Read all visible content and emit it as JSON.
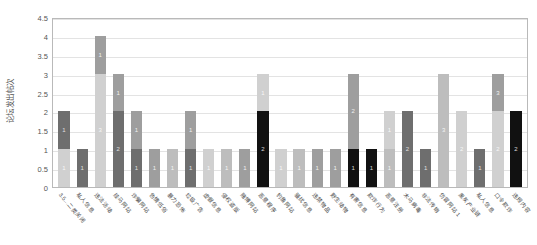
{
  "chart": {
    "type": "bar",
    "title": "",
    "ylabel": "论坛发出帖次",
    "xlabel": ""
  },
  "axis": {
    "yticks": [
      "0",
      "0.5",
      "1",
      "1.5",
      "2",
      "2.5",
      "3",
      "3.5",
      "4",
      "4.5"
    ],
    "ymin": 0,
    "ymax": 4.5
  },
  "colors": {
    "light": "#d0d0d0",
    "mid_light": "#bdbdbd",
    "mid": "#9e9e9e",
    "dark": "#6e6e6e",
    "black": "#111111",
    "grid": "#e3e3e3",
    "frame": "#b9b9b9"
  },
  "chart_data": {
    "type": "bar",
    "title": "",
    "xlabel": "",
    "ylabel": "论坛发出帖次",
    "ylim": [
      0,
      4.5
    ],
    "grid": true,
    "legend": "none",
    "stacked": true,
    "categories": [
      "3.5…二类关闭",
      "私人信息",
      "违法活动",
      "挂马网站",
      "诈骗网站",
      "色情低俗",
      "暴力恐怖",
      "垃圾广告",
      "虚假信息",
      "侵权盗版",
      "赌博网站",
      "恶意程序",
      "钓鱼网站",
      "骚扰信息",
      "违禁物品",
      "野生动物",
      "有害信息",
      "欺诈行为",
      "恶意注册",
      "木马病毒",
      "非法传销",
      "仿冒网站 1",
      "黑灰产业链",
      "私人信息",
      "口令欺诈",
      "违规内容"
    ],
    "values": [
      2,
      1,
      4,
      3,
      2,
      1,
      1,
      2,
      1,
      1,
      1,
      3,
      1,
      1,
      1,
      1,
      3,
      1,
      2,
      2,
      1,
      3,
      2,
      1,
      3,
      2
    ],
    "segments": [
      [
        {
          "v": 1,
          "shade": "light",
          "label": "1"
        },
        {
          "v": 1,
          "shade": "dark",
          "label": "1"
        }
      ],
      [
        {
          "v": 1,
          "shade": "dark",
          "label": "1"
        }
      ],
      [
        {
          "v": 3,
          "shade": "light",
          "label": "3"
        },
        {
          "v": 1,
          "shade": "mid",
          "label": "1"
        }
      ],
      [
        {
          "v": 2,
          "shade": "dark",
          "label": "2"
        },
        {
          "v": 1,
          "shade": "mid",
          "label": "1"
        }
      ],
      [
        {
          "v": 1,
          "shade": "dark",
          "label": "1"
        },
        {
          "v": 1,
          "shade": "mid",
          "label": "1"
        }
      ],
      [
        {
          "v": 1,
          "shade": "mid",
          "label": "1"
        }
      ],
      [
        {
          "v": 1,
          "shade": "mid_light",
          "label": "1"
        }
      ],
      [
        {
          "v": 1,
          "shade": "dark",
          "label": "1"
        },
        {
          "v": 1,
          "shade": "mid",
          "label": "1"
        }
      ],
      [
        {
          "v": 1,
          "shade": "light",
          "label": "1"
        }
      ],
      [
        {
          "v": 1,
          "shade": "mid_light",
          "label": "1"
        }
      ],
      [
        {
          "v": 1,
          "shade": "mid",
          "label": "1"
        }
      ],
      [
        {
          "v": 2,
          "shade": "black",
          "label": "2"
        },
        {
          "v": 1,
          "shade": "light",
          "label": "1"
        }
      ],
      [
        {
          "v": 1,
          "shade": "light",
          "label": "1"
        }
      ],
      [
        {
          "v": 1,
          "shade": "mid_light",
          "label": "1"
        }
      ],
      [
        {
          "v": 1,
          "shade": "mid",
          "label": "1"
        }
      ],
      [
        {
          "v": 1,
          "shade": "mid",
          "label": "1"
        }
      ],
      [
        {
          "v": 1,
          "shade": "black",
          "label": "1"
        },
        {
          "v": 2,
          "shade": "mid",
          "label": "2"
        }
      ],
      [
        {
          "v": 1,
          "shade": "black",
          "label": "1"
        }
      ],
      [
        {
          "v": 1,
          "shade": "mid_light",
          "label": "1"
        },
        {
          "v": 1,
          "shade": "light",
          "label": "1"
        }
      ],
      [
        {
          "v": 2,
          "shade": "dark",
          "label": "2"
        }
      ],
      [
        {
          "v": 1,
          "shade": "dark",
          "label": "1"
        }
      ],
      [
        {
          "v": 3,
          "shade": "mid_light",
          "label": "3"
        }
      ],
      [
        {
          "v": 2,
          "shade": "light",
          "label": "2"
        }
      ],
      [
        {
          "v": 1,
          "shade": "dark",
          "label": "1"
        }
      ],
      [
        {
          "v": 2,
          "shade": "light",
          "label": "2"
        },
        {
          "v": 1,
          "shade": "mid",
          "label": "3"
        }
      ],
      [
        {
          "v": 2,
          "shade": "black",
          "label": "2"
        }
      ]
    ]
  }
}
